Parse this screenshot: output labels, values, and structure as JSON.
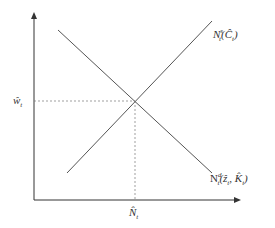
{
  "diagram": {
    "type": "supply-demand",
    "axes": {
      "x_axis_label": "",
      "y_axis_label": ""
    },
    "curves": [
      {
        "name": "labor-supply",
        "base": "N",
        "sup": "s",
        "sub": "t",
        "args": "(Ĉ",
        "args_sub": "t",
        "args_close": ")"
      },
      {
        "name": "labor-demand",
        "base": "N",
        "sup": "d",
        "sub": "t",
        "args": "(ẑ",
        "args_sub": "t",
        "args_mid": ", K̂",
        "args_sub2": "t",
        "args_close": ")"
      }
    ],
    "equilibrium": {
      "wage_label_base": "ŵ",
      "wage_label_sub": "t",
      "quantity_label_base": "N̂",
      "quantity_label_sub": "t"
    },
    "colors": {
      "axis": "#333333",
      "curve": "#555555",
      "guide": "#777777",
      "background": "#ffffff"
    }
  }
}
